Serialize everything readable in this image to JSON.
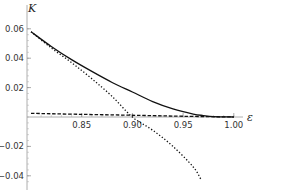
{
  "chart_data": {
    "type": "line",
    "title": "",
    "xlabel": "ε",
    "ylabel": "K",
    "xlim": [
      0.8,
      1.02
    ],
    "ylim": [
      -0.045,
      0.065
    ],
    "grid": false,
    "legend": null,
    "x_ticks": [
      {
        "value": 0.85,
        "label": "0.85"
      },
      {
        "value": 0.9,
        "label": "0.90"
      },
      {
        "value": 0.95,
        "label": "0.95"
      },
      {
        "value": 1.0,
        "label": "1.00"
      }
    ],
    "y_ticks": [
      {
        "value": 0.06,
        "label": "0.06"
      },
      {
        "value": 0.04,
        "label": "0.04"
      },
      {
        "value": 0.02,
        "label": "0.02"
      },
      {
        "value": -0.02,
        "label": "-0.02"
      },
      {
        "value": -0.04,
        "label": "-0.04"
      }
    ],
    "series": [
      {
        "name": "solid",
        "style": "solid",
        "x": [
          0.8,
          0.82,
          0.84,
          0.86,
          0.88,
          0.9,
          0.92,
          0.94,
          0.96,
          0.97,
          0.98,
          1.0
        ],
        "values": [
          0.058,
          0.048,
          0.039,
          0.031,
          0.0235,
          0.017,
          0.0105,
          0.0055,
          0.002,
          0.001,
          0.0003,
          0.0
        ]
      },
      {
        "name": "dotted",
        "style": "dotted",
        "x": [
          0.8,
          0.82,
          0.84,
          0.86,
          0.88,
          0.9,
          0.92,
          0.94,
          0.96,
          0.968
        ],
        "values": [
          0.058,
          0.047,
          0.037,
          0.026,
          0.014,
          0.0,
          -0.009,
          -0.02,
          -0.034,
          -0.043
        ]
      },
      {
        "name": "dashed",
        "style": "dashed",
        "x": [
          0.8,
          0.85,
          0.9,
          0.95,
          1.0
        ],
        "values": [
          0.0025,
          0.0018,
          0.0012,
          0.0005,
          0.0
        ]
      }
    ]
  }
}
